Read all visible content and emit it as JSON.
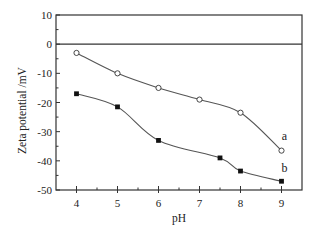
{
  "chart_data": {
    "type": "line",
    "title": "",
    "xlabel": "pH",
    "ylabel": "Zeta potential /mV",
    "xlim": [
      3.5,
      9.5
    ],
    "ylim": [
      -50,
      10
    ],
    "x_ticks": [
      4,
      5,
      6,
      7,
      8,
      9
    ],
    "y_ticks": [
      10,
      0,
      -10,
      -20,
      -30,
      -40,
      -50
    ],
    "grid": false,
    "zero_line": true,
    "legend": "inline labels at right end of curves",
    "series": [
      {
        "name": "a",
        "marker": "open-circle",
        "x": [
          4,
          5,
          6,
          7,
          8,
          9
        ],
        "values": [
          -3,
          -10,
          -15,
          -19,
          -23.5,
          -36.5
        ]
      },
      {
        "name": "b",
        "marker": "filled-square",
        "x": [
          4,
          5,
          6,
          7.5,
          8,
          9
        ],
        "values": [
          -17,
          -21.5,
          -33,
          -39,
          -43.5,
          -47
        ]
      }
    ]
  },
  "colors": {
    "axis": "#333333",
    "line": "#555555",
    "marker_fill_b": "#111111",
    "marker_fill_a": "#ffffff"
  }
}
